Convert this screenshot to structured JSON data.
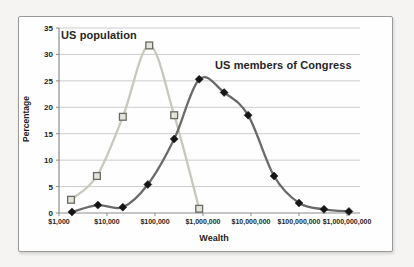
{
  "window": {
    "background": "#f5f4f2"
  },
  "style": {
    "grid_color": "#cccccc",
    "axis_color": "#8c8c8c",
    "tick_text_color": "#1f1f1f",
    "frame_border_color": "#9a9a9a",
    "chart_background": "#fefefe"
  },
  "chart_data": {
    "type": "line",
    "title": "",
    "xlabel": "Wealth",
    "ylabel": "Percentage",
    "x_scale": "log10",
    "grid": "horizontal",
    "legend": "inline-text-labels",
    "ylim": [
      0,
      35
    ],
    "xlim_log10": [
      3,
      9.25
    ],
    "y_ticks": [
      0,
      5,
      10,
      15,
      20,
      25,
      30,
      35
    ],
    "x_tick_log10": [
      3,
      4,
      5,
      6,
      7,
      8,
      9
    ],
    "x_tick_labels": [
      "$1,000",
      "$10,000",
      "$100,000",
      "$1,000,000",
      "$10,000,000",
      "$100,000,000",
      "$1,000,000,000"
    ],
    "series": [
      {
        "name": "US population",
        "marker": "square",
        "line_color": "#c6cabb",
        "marker_fill": "#e3e5dc",
        "marker_stroke": "#676b61",
        "x_log10": [
          3.25,
          3.79,
          4.33,
          4.88,
          5.4,
          5.92
        ],
        "y": [
          2.5,
          7.0,
          18.2,
          31.7,
          18.5,
          0.8
        ]
      },
      {
        "name": "US members of Congress",
        "marker": "diamond",
        "line_color": "#6a6a6a",
        "marker_fill": "#161616",
        "marker_stroke": "#161616",
        "x_log10": [
          3.27,
          3.81,
          4.33,
          4.85,
          5.4,
          5.92,
          6.44,
          6.94,
          7.48,
          8.0,
          8.52,
          9.04
        ],
        "y": [
          0.2,
          1.5,
          1.1,
          5.4,
          14.0,
          25.3,
          22.8,
          18.5,
          7.0,
          1.9,
          0.7,
          0.3
        ]
      }
    ]
  }
}
